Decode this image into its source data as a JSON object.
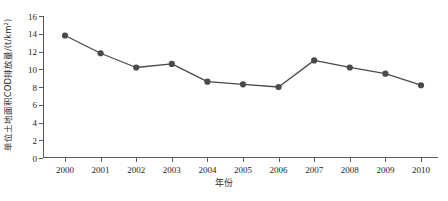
{
  "chart_data": {
    "type": "line",
    "title": "",
    "xlabel": "年份",
    "ylabel": "单位土地面积COD排放量/(t/km²)",
    "categories": [
      "2000",
      "2001",
      "2002",
      "2003",
      "2004",
      "2005",
      "2006",
      "2007",
      "2008",
      "2009",
      "2010"
    ],
    "values": [
      13.8,
      11.8,
      10.2,
      10.6,
      8.6,
      8.3,
      8.0,
      11.0,
      10.2,
      9.5,
      8.2
    ],
    "series": [
      {
        "name": "单位土地面积COD排放量",
        "values": [
          13.8,
          11.8,
          10.2,
          10.6,
          8.6,
          8.3,
          8.0,
          11.0,
          10.2,
          9.5,
          8.2
        ]
      }
    ],
    "ylim": [
      0,
      16
    ],
    "yticks": [
      0,
      2,
      4,
      6,
      8,
      10,
      12,
      14,
      16
    ],
    "ytick_labels": [
      "0",
      "2",
      "4",
      "6",
      "8",
      "10",
      "12",
      "14",
      "16"
    ],
    "grid": false,
    "legend": false,
    "legend_position": "none",
    "marker": "circle",
    "line_color": "#4a4a4a",
    "marker_color": "#4a4a4a",
    "axis_color": "#5a5a5a",
    "background_color": "#ffffff"
  }
}
